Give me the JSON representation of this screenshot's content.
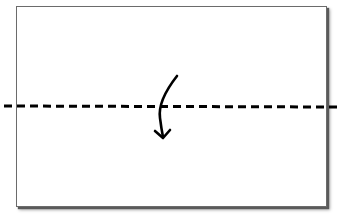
{
  "diagram": {
    "type": "paper-folding-instruction",
    "paper": {
      "shape": "rectangle",
      "fill": "#ffffff",
      "border": "#6b6b6b",
      "shadow": true
    },
    "fold_line": {
      "style": "dashed",
      "orientation": "horizontal",
      "color": "#000000",
      "position": "middle"
    },
    "arrow": {
      "direction": "down",
      "meaning": "fold-top-half-down",
      "color": "#000000"
    }
  }
}
